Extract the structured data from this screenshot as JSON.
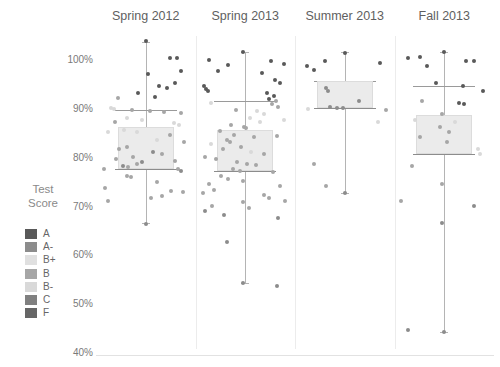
{
  "chart_data": {
    "type": "scatter",
    "title": "",
    "xlabel": "",
    "ylabel": "Test Score",
    "ylim": [
      40,
      100
    ],
    "ytick_labels": [
      "100%",
      "90%",
      "80%",
      "70%",
      "60%",
      "50%",
      "40%"
    ],
    "ytick_values": [
      100,
      90,
      80,
      70,
      60,
      50,
      40
    ],
    "grid": false,
    "legend_position": "left",
    "legend_title_lines": [
      "Test",
      "Score"
    ],
    "legend": [
      {
        "label": "A",
        "color": "#595959"
      },
      {
        "label": "A-",
        "color": "#8c8c8c"
      },
      {
        "label": "B+",
        "color": "#e0e0e0"
      },
      {
        "label": "B",
        "color": "#a6a6a6"
      },
      {
        "label": "B-",
        "color": "#d9d9d9"
      },
      {
        "label": "C",
        "color": "#808080"
      },
      {
        "label": "F",
        "color": "#666666"
      }
    ],
    "categories": [
      "Spring 2012",
      "Spring 2013",
      "Summer 2013",
      "Fall 2013"
    ],
    "series": [
      {
        "name": "Spring 2012",
        "box": {
          "whisker_low": 66.5,
          "q1": 77.5,
          "median": 81.0,
          "q3": 86.0,
          "hinge_mid": 89.5,
          "whisker_high": 103.5
        },
        "points": [
          {
            "x": 0.5,
            "y": 103.6,
            "grade": "A"
          },
          {
            "x": 0.77,
            "y": 100.3,
            "grade": "A"
          },
          {
            "x": 0.84,
            "y": 100.3,
            "grade": "A"
          },
          {
            "x": 0.88,
            "y": 97.6,
            "grade": "A"
          },
          {
            "x": 0.53,
            "y": 97.0,
            "grade": "A"
          },
          {
            "x": 0.82,
            "y": 95.0,
            "grade": "A"
          },
          {
            "x": 0.64,
            "y": 94.5,
            "grade": "A"
          },
          {
            "x": 0.73,
            "y": 94.0,
            "grade": "A"
          },
          {
            "x": 0.42,
            "y": 93.0,
            "grade": "A"
          },
          {
            "x": 0.6,
            "y": 92.3,
            "grade": "A"
          },
          {
            "x": 0.2,
            "y": 92.0,
            "grade": "B"
          },
          {
            "x": 0.12,
            "y": 90.0,
            "grade": "B-"
          },
          {
            "x": 0.15,
            "y": 89.8,
            "grade": "B-"
          },
          {
            "x": 0.35,
            "y": 89.5,
            "grade": "B"
          },
          {
            "x": 0.55,
            "y": 89.3,
            "grade": "B"
          },
          {
            "x": 0.7,
            "y": 89.2,
            "grade": "B"
          },
          {
            "x": 0.88,
            "y": 89.0,
            "grade": "B"
          },
          {
            "x": 0.3,
            "y": 88.0,
            "grade": "B-"
          },
          {
            "x": 0.16,
            "y": 87.0,
            "grade": "B"
          },
          {
            "x": 0.46,
            "y": 87.5,
            "grade": "B-"
          },
          {
            "x": 0.81,
            "y": 86.8,
            "grade": "B-"
          },
          {
            "x": 0.86,
            "y": 86.5,
            "grade": "B-"
          },
          {
            "x": 0.26,
            "y": 85.5,
            "grade": "B-"
          },
          {
            "x": 0.09,
            "y": 85.0,
            "grade": "B-"
          },
          {
            "x": 0.4,
            "y": 85.0,
            "grade": "B-"
          },
          {
            "x": 0.76,
            "y": 84.5,
            "grade": "B"
          },
          {
            "x": 0.62,
            "y": 83.5,
            "grade": "B-"
          },
          {
            "x": 0.92,
            "y": 83.0,
            "grade": "B"
          },
          {
            "x": 0.3,
            "y": 82.0,
            "grade": "B"
          },
          {
            "x": 0.21,
            "y": 81.5,
            "grade": "B"
          },
          {
            "x": 0.58,
            "y": 81.0,
            "grade": "A-"
          },
          {
            "x": 0.68,
            "y": 80.5,
            "grade": "B"
          },
          {
            "x": 0.36,
            "y": 80.0,
            "grade": "B"
          },
          {
            "x": 0.17,
            "y": 79.5,
            "grade": "B"
          },
          {
            "x": 0.46,
            "y": 79.0,
            "grade": "A-"
          },
          {
            "x": 0.82,
            "y": 79.2,
            "grade": "B"
          },
          {
            "x": 0.25,
            "y": 78.0,
            "grade": "A-"
          },
          {
            "x": 0.31,
            "y": 77.8,
            "grade": "B"
          },
          {
            "x": 0.4,
            "y": 78.5,
            "grade": "B"
          },
          {
            "x": 0.85,
            "y": 77.5,
            "grade": "B"
          },
          {
            "x": 0.88,
            "y": 77.0,
            "grade": "A-"
          },
          {
            "x": 0.04,
            "y": 77.5,
            "grade": "B"
          },
          {
            "x": 0.29,
            "y": 76.0,
            "grade": "B"
          },
          {
            "x": 0.34,
            "y": 75.8,
            "grade": "B"
          },
          {
            "x": 0.62,
            "y": 74.8,
            "grade": "B"
          },
          {
            "x": 0.05,
            "y": 73.5,
            "grade": "B"
          },
          {
            "x": 0.78,
            "y": 73.0,
            "grade": "B"
          },
          {
            "x": 0.91,
            "y": 72.8,
            "grade": "B"
          },
          {
            "x": 0.68,
            "y": 72.0,
            "grade": "B"
          },
          {
            "x": 0.56,
            "y": 71.5,
            "grade": "B"
          },
          {
            "x": 0.09,
            "y": 71.0,
            "grade": "B"
          },
          {
            "x": 0.5,
            "y": 66.3,
            "grade": "A-"
          }
        ]
      },
      {
        "name": "Spring 2013",
        "box": {
          "whisker_low": 54.2,
          "q1": 77.0,
          "median": 80.5,
          "q3": 85.5,
          "hinge_mid": 91.5,
          "whisker_high": 101.5
        },
        "points": [
          {
            "x": 0.47,
            "y": 101.4,
            "grade": "A"
          },
          {
            "x": 0.1,
            "y": 99.8,
            "grade": "A"
          },
          {
            "x": 0.78,
            "y": 99.5,
            "grade": "A"
          },
          {
            "x": 0.92,
            "y": 99.0,
            "grade": "A"
          },
          {
            "x": 0.31,
            "y": 98.8,
            "grade": "A"
          },
          {
            "x": 0.2,
            "y": 97.5,
            "grade": "A"
          },
          {
            "x": 0.68,
            "y": 97.2,
            "grade": "A"
          },
          {
            "x": 0.82,
            "y": 95.8,
            "grade": "A"
          },
          {
            "x": 0.88,
            "y": 95.0,
            "grade": "A"
          },
          {
            "x": 0.05,
            "y": 94.5,
            "grade": "A"
          },
          {
            "x": 0.07,
            "y": 93.8,
            "grade": "A"
          },
          {
            "x": 0.09,
            "y": 93.5,
            "grade": "A"
          },
          {
            "x": 0.74,
            "y": 93.0,
            "grade": "A"
          },
          {
            "x": 0.81,
            "y": 92.5,
            "grade": "A"
          },
          {
            "x": 0.76,
            "y": 91.8,
            "grade": "A"
          },
          {
            "x": 0.84,
            "y": 91.5,
            "grade": "B"
          },
          {
            "x": 0.13,
            "y": 91.0,
            "grade": "B-"
          },
          {
            "x": 0.79,
            "y": 90.8,
            "grade": "B"
          },
          {
            "x": 0.86,
            "y": 90.2,
            "grade": "B"
          },
          {
            "x": 0.4,
            "y": 89.5,
            "grade": "B"
          },
          {
            "x": 0.63,
            "y": 89.3,
            "grade": "B-"
          },
          {
            "x": 0.71,
            "y": 88.8,
            "grade": "B-"
          },
          {
            "x": 0.55,
            "y": 88.0,
            "grade": "B-"
          },
          {
            "x": 0.92,
            "y": 87.5,
            "grade": "B-"
          },
          {
            "x": 0.66,
            "y": 87.0,
            "grade": "B-"
          },
          {
            "x": 0.34,
            "y": 86.5,
            "grade": "B"
          },
          {
            "x": 0.49,
            "y": 86.0,
            "grade": "B"
          },
          {
            "x": 0.51,
            "y": 85.8,
            "grade": "B"
          },
          {
            "x": 0.22,
            "y": 85.2,
            "grade": "B"
          },
          {
            "x": 0.38,
            "y": 84.5,
            "grade": "B"
          },
          {
            "x": 0.6,
            "y": 84.0,
            "grade": "B"
          },
          {
            "x": 0.85,
            "y": 84.2,
            "grade": "B"
          },
          {
            "x": 0.3,
            "y": 83.5,
            "grade": "B"
          },
          {
            "x": 0.33,
            "y": 83.0,
            "grade": "B"
          },
          {
            "x": 0.13,
            "y": 82.5,
            "grade": "B-"
          },
          {
            "x": 0.45,
            "y": 82.0,
            "grade": "B"
          },
          {
            "x": 0.26,
            "y": 81.5,
            "grade": "B"
          },
          {
            "x": 0.56,
            "y": 81.0,
            "grade": "B-"
          },
          {
            "x": 0.71,
            "y": 80.5,
            "grade": "B"
          },
          {
            "x": 0.06,
            "y": 80.0,
            "grade": "B"
          },
          {
            "x": 0.18,
            "y": 79.5,
            "grade": "B"
          },
          {
            "x": 0.41,
            "y": 79.0,
            "grade": "B"
          },
          {
            "x": 0.52,
            "y": 78.5,
            "grade": "B"
          },
          {
            "x": 0.62,
            "y": 78.2,
            "grade": "B"
          },
          {
            "x": 0.37,
            "y": 77.5,
            "grade": "B"
          },
          {
            "x": 0.44,
            "y": 77.0,
            "grade": "B"
          },
          {
            "x": 0.8,
            "y": 76.8,
            "grade": "B"
          },
          {
            "x": 0.23,
            "y": 76.0,
            "grade": "B"
          },
          {
            "x": 0.31,
            "y": 75.5,
            "grade": "B"
          },
          {
            "x": 0.48,
            "y": 75.0,
            "grade": "B"
          },
          {
            "x": 0.1,
            "y": 74.5,
            "grade": "B"
          },
          {
            "x": 0.88,
            "y": 74.0,
            "grade": "B"
          },
          {
            "x": 0.16,
            "y": 73.2,
            "grade": "B"
          },
          {
            "x": 0.04,
            "y": 72.5,
            "grade": "B"
          },
          {
            "x": 0.7,
            "y": 72.2,
            "grade": "B"
          },
          {
            "x": 0.76,
            "y": 71.5,
            "grade": "B"
          },
          {
            "x": 0.93,
            "y": 71.0,
            "grade": "B"
          },
          {
            "x": 0.47,
            "y": 70.8,
            "grade": "B"
          },
          {
            "x": 0.14,
            "y": 70.0,
            "grade": "B"
          },
          {
            "x": 0.54,
            "y": 69.5,
            "grade": "B"
          },
          {
            "x": 0.06,
            "y": 68.8,
            "grade": "A-"
          },
          {
            "x": 0.27,
            "y": 68.0,
            "grade": "A-"
          },
          {
            "x": 0.86,
            "y": 67.5,
            "grade": "A-"
          },
          {
            "x": 0.3,
            "y": 62.5,
            "grade": "A-"
          },
          {
            "x": 0.47,
            "y": 54.2,
            "grade": "A-"
          },
          {
            "x": 0.85,
            "y": 53.5,
            "grade": "A-"
          }
        ]
      },
      {
        "name": "Summer 2013",
        "box": {
          "whisker_low": 72.5,
          "q1": 90.0,
          "median": 90.5,
          "q3": 95.5,
          "hinge_mid": 95.5,
          "whisker_high": 101.5
        },
        "points": [
          {
            "x": 0.5,
            "y": 101.3,
            "grade": "A"
          },
          {
            "x": 0.28,
            "y": 99.5,
            "grade": "A"
          },
          {
            "x": 0.88,
            "y": 99.2,
            "grade": "A"
          },
          {
            "x": 0.09,
            "y": 98.5,
            "grade": "A"
          },
          {
            "x": 0.16,
            "y": 97.8,
            "grade": "A"
          },
          {
            "x": 0.3,
            "y": 94.0,
            "grade": "A-"
          },
          {
            "x": 0.32,
            "y": 93.5,
            "grade": "A-"
          },
          {
            "x": 0.66,
            "y": 91.5,
            "grade": "A-"
          },
          {
            "x": 0.34,
            "y": 90.2,
            "grade": "A-"
          },
          {
            "x": 0.42,
            "y": 90.0,
            "grade": "A-"
          },
          {
            "x": 0.48,
            "y": 90.0,
            "grade": "A-"
          },
          {
            "x": 0.1,
            "y": 89.8,
            "grade": "B-"
          },
          {
            "x": 0.95,
            "y": 89.5,
            "grade": "B"
          },
          {
            "x": 0.86,
            "y": 87.0,
            "grade": "B-"
          },
          {
            "x": 0.16,
            "y": 78.5,
            "grade": "B"
          },
          {
            "x": 0.3,
            "y": 74.0,
            "grade": "B"
          },
          {
            "x": 0.5,
            "y": 72.5,
            "grade": "A-"
          }
        ]
      },
      {
        "name": "Fall 2013",
        "box": {
          "whisker_low": 44.0,
          "q1": 80.5,
          "median": 85.5,
          "q3": 88.5,
          "hinge_mid": 94.5,
          "whisker_high": 101.5
        },
        "points": [
          {
            "x": 0.5,
            "y": 101.4,
            "grade": "A"
          },
          {
            "x": 0.1,
            "y": 100.2,
            "grade": "A"
          },
          {
            "x": 0.23,
            "y": 100.5,
            "grade": "A"
          },
          {
            "x": 0.74,
            "y": 99.5,
            "grade": "A"
          },
          {
            "x": 0.82,
            "y": 99.6,
            "grade": "A"
          },
          {
            "x": 0.31,
            "y": 98.5,
            "grade": "A"
          },
          {
            "x": 0.41,
            "y": 95.0,
            "grade": "A"
          },
          {
            "x": 0.7,
            "y": 94.5,
            "grade": "A"
          },
          {
            "x": 0.92,
            "y": 93.5,
            "grade": "A"
          },
          {
            "x": 0.26,
            "y": 91.5,
            "grade": "B"
          },
          {
            "x": 0.66,
            "y": 91.0,
            "grade": "A"
          },
          {
            "x": 0.72,
            "y": 90.8,
            "grade": "A"
          },
          {
            "x": 0.47,
            "y": 88.8,
            "grade": "B"
          },
          {
            "x": 0.18,
            "y": 87.5,
            "grade": "B-"
          },
          {
            "x": 0.62,
            "y": 87.0,
            "grade": "B-"
          },
          {
            "x": 0.45,
            "y": 86.0,
            "grade": "B"
          },
          {
            "x": 0.55,
            "y": 85.0,
            "grade": "B"
          },
          {
            "x": 0.24,
            "y": 84.0,
            "grade": "B"
          },
          {
            "x": 0.53,
            "y": 83.0,
            "grade": "B"
          },
          {
            "x": 0.87,
            "y": 81.5,
            "grade": "B-"
          },
          {
            "x": 0.89,
            "y": 80.5,
            "grade": "B-"
          },
          {
            "x": 0.15,
            "y": 78.0,
            "grade": "B"
          },
          {
            "x": 0.48,
            "y": 74.5,
            "grade": "B"
          },
          {
            "x": 0.03,
            "y": 71.0,
            "grade": "B"
          },
          {
            "x": 0.83,
            "y": 70.0,
            "grade": "A-"
          },
          {
            "x": 0.47,
            "y": 66.5,
            "grade": "A-"
          },
          {
            "x": 0.1,
            "y": 44.5,
            "grade": "A-"
          },
          {
            "x": 0.5,
            "y": 44.0,
            "grade": "A-"
          }
        ]
      }
    ]
  }
}
